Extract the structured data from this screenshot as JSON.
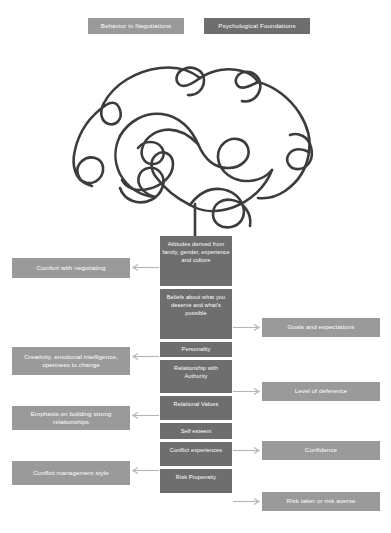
{
  "header": {
    "left_badge": "Behavior in Negotiations",
    "right_badge": "Psychological Foundations"
  },
  "illustration": {
    "name": "brain-line-art",
    "description": "continuous single-line doodle of a human brain in profile with a stem"
  },
  "colors": {
    "center_box": "#6e6e6e",
    "side_box": "#9a9a9a",
    "header_left": "#9a9a9a",
    "header_right": "#6e6e6e",
    "text": "#ffffff",
    "line": "#3c3c3c",
    "arrow": "#b5b5b5"
  },
  "center_column": [
    {
      "id": "attitudes",
      "label": "Attitudes derived from family, gender, experience and culture"
    },
    {
      "id": "beliefs",
      "label": "Beliefs about what you deserve and what's possible"
    },
    {
      "id": "personality",
      "label": "Personality"
    },
    {
      "id": "authority",
      "label": "Relationship with Authority"
    },
    {
      "id": "relational",
      "label": "Relational Values"
    },
    {
      "id": "self-esteem",
      "label": "Self esteem"
    },
    {
      "id": "conflict-exp",
      "label": "Conflict experiences"
    },
    {
      "id": "risk",
      "label": "Risk Propensity"
    }
  ],
  "left_column": [
    {
      "id": "comfort",
      "label": "Comfort with negotiating"
    },
    {
      "id": "creativity",
      "label": "Creativity, emotional intelligence, openness to change"
    },
    {
      "id": "relationships",
      "label": "Emphasis on building strong relationships"
    },
    {
      "id": "conflict-mgmt",
      "label": "Conflict management style"
    }
  ],
  "right_column": [
    {
      "id": "goals",
      "label": "Goals and expectations"
    },
    {
      "id": "deference",
      "label": "Level of deference"
    },
    {
      "id": "confidence",
      "label": "Confidence"
    },
    {
      "id": "risk-taker",
      "label": "Risk taker or risk averse"
    }
  ]
}
